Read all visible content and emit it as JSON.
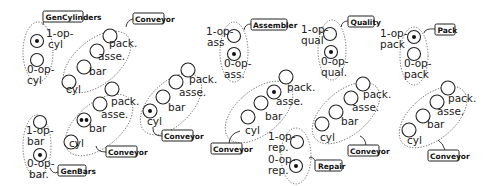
{
  "diagram": {
    "type": "petri-net-components",
    "components": [
      {
        "id": "gencyl",
        "tag": "GenCylinders",
        "places": [
          {
            "label": "1-op-\ncyl",
            "tokens": 1
          },
          {
            "label": "0-op-\ncyl",
            "tokens": 0
          }
        ]
      },
      {
        "id": "conv1",
        "tag": "Conveyor",
        "places": [
          {
            "label": "cyl",
            "tokens": 0
          },
          {
            "label": "bar",
            "tokens": 0
          },
          {
            "label": "asse.",
            "tokens": 0
          },
          {
            "label": "pack.",
            "tokens": 0
          }
        ]
      },
      {
        "id": "genbars",
        "tag": "GenBars",
        "places": [
          {
            "label": "1-op-\nbar",
            "tokens": 0
          },
          {
            "label": "0-op-\nbar",
            "tokens": 1
          }
        ]
      },
      {
        "id": "conv2",
        "tag": "Conveyor",
        "places": [
          {
            "label": "cyl",
            "tokens": 0
          },
          {
            "label": "bar",
            "tokens": 2
          },
          {
            "label": "asse.",
            "tokens": 0
          },
          {
            "label": "pack.",
            "tokens": 0
          }
        ]
      },
      {
        "id": "conv3",
        "tag": "Conveyor",
        "places": [
          {
            "label": "cyl",
            "tokens": 1
          },
          {
            "label": "bar",
            "tokens": 0
          },
          {
            "label": "asse.",
            "tokens": 0
          },
          {
            "label": "pack.",
            "tokens": 0
          }
        ]
      },
      {
        "id": "assembler",
        "tag": "Assembler",
        "places": [
          {
            "label": "1-op-\nass",
            "tokens": 0
          },
          {
            "label": "0-op-\nass.",
            "tokens": 1
          }
        ]
      },
      {
        "id": "conv4",
        "tag": "Conveyor",
        "places": [
          {
            "label": "cyl",
            "tokens": 0
          },
          {
            "label": "bar",
            "tokens": 0
          },
          {
            "label": "asse.",
            "tokens": 1
          },
          {
            "label": "pack.",
            "tokens": 0
          }
        ]
      },
      {
        "id": "repair",
        "tag": "Repair",
        "places": [
          {
            "label": "1-op-\nrep.",
            "tokens": 0
          },
          {
            "label": "0-op-\nrep.",
            "tokens": 1
          }
        ]
      },
      {
        "id": "quality",
        "tag": "Quality",
        "places": [
          {
            "label": "1-op-\nqual",
            "tokens": 0
          },
          {
            "label": "0-op-\nqual.",
            "tokens": 1
          }
        ]
      },
      {
        "id": "conv5",
        "tag": "Conveyor",
        "places": [
          {
            "label": "cyl",
            "tokens": 0
          },
          {
            "label": "bar",
            "tokens": 0
          },
          {
            "label": "asse.",
            "tokens": 0
          },
          {
            "label": "pack.",
            "tokens": 0
          }
        ]
      },
      {
        "id": "pack",
        "tag": "Pack",
        "places": [
          {
            "label": "1-op-\npack",
            "tokens": 1
          },
          {
            "label": "0-op-\npack",
            "tokens": 0
          }
        ]
      },
      {
        "id": "conv6",
        "tag": "Conveyor",
        "places": [
          {
            "label": "cyl",
            "tokens": 0
          },
          {
            "label": "bar",
            "tokens": 0
          },
          {
            "label": "asse.",
            "tokens": 0
          },
          {
            "label": "pack.",
            "tokens": 0
          }
        ]
      }
    ],
    "texts": {
      "gencyl_tag": "GenCylinders",
      "gencyl_p1a": "1-op-",
      "gencyl_p1b": "cyl",
      "gencyl_p0a": "0-op-",
      "gencyl_p0b": "cyl",
      "genbars_tag": "GenBars",
      "genbars_p1a": "1-op-",
      "genbars_p1b": "bar",
      "genbars_p0a": "0-op-",
      "genbars_p0b": "bar.",
      "assembler_tag": "Assembler",
      "ass_p1a": "1-op-",
      "ass_p1b": "ass",
      "ass_p0a": "0-op-",
      "ass_p0b": "ass.",
      "repair_tag": "Repair",
      "rep_p1a": "1-op-",
      "rep_p1b": "rep.",
      "rep_p0a": "0-op-",
      "rep_p0b": "rep.",
      "quality_tag": "Quality",
      "qual_p1a": "1-op-",
      "qual_p1b": "qual",
      "qual_p0a": "0-op-",
      "qual_p0b": "qual.",
      "pack_tag": "Pack",
      "pack_p1a": "1-op-",
      "pack_p1b": "pack",
      "pack_p0a": "0-op-",
      "pack_p0b": "pack",
      "conveyor_tag": "Conveyor",
      "cyl": "cyl",
      "bar": "bar",
      "asse": "asse.",
      "pack": "pack."
    }
  }
}
